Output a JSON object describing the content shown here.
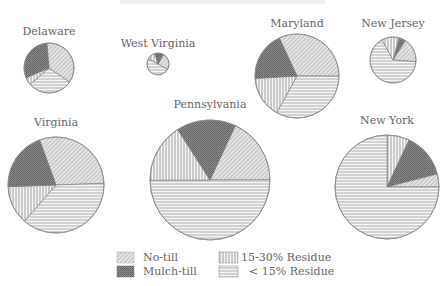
{
  "chart_data": {
    "type": "pie",
    "title": "",
    "legend": {
      "position": "bottom-center",
      "entries": [
        {
          "key": "no_till",
          "label": "No-till"
        },
        {
          "key": "mulch_till",
          "label": "Mulch-till"
        },
        {
          "key": "residue_15_30",
          "label": "15-30% Residue"
        },
        {
          "key": "residue_lt_15",
          "label": "< 15% Residue"
        }
      ]
    },
    "categories": [
      "No-till",
      "Mulch-till",
      "15-30% Residue",
      "< 15% Residue"
    ],
    "pies": [
      {
        "state": "Delaware",
        "cx": 49,
        "cy": 68,
        "r": 25,
        "label_y": 35,
        "slices": [
          {
            "cat": "no_till",
            "value": 36
          },
          {
            "cat": "residue_lt_15",
            "value": 29
          },
          {
            "cat": "residue_15_30",
            "value": 5
          },
          {
            "cat": "mulch_till",
            "value": 30
          }
        ],
        "start_angle": -95
      },
      {
        "state": "West Virginia",
        "cx": 158,
        "cy": 64,
        "r": 11,
        "label_y": 47,
        "slices": [
          {
            "cat": "no_till",
            "value": 25
          },
          {
            "cat": "residue_lt_15",
            "value": 50
          },
          {
            "cat": "residue_15_30",
            "value": 12
          },
          {
            "cat": "mulch_till",
            "value": 13
          }
        ],
        "start_angle": -60
      },
      {
        "state": "Maryland",
        "cx": 297,
        "cy": 76,
        "r": 42,
        "label_y": 27,
        "slices": [
          {
            "cat": "no_till",
            "value": 32
          },
          {
            "cat": "residue_lt_15",
            "value": 33
          },
          {
            "cat": "residue_15_30",
            "value": 16
          },
          {
            "cat": "mulch_till",
            "value": 19
          }
        ],
        "start_angle": -115
      },
      {
        "state": "New Jersey",
        "cx": 393,
        "cy": 60,
        "r": 23,
        "label_y": 27,
        "slices": [
          {
            "cat": "mulch_till",
            "value": 5
          },
          {
            "cat": "no_till",
            "value": 17
          },
          {
            "cat": "residue_lt_15",
            "value": 66
          },
          {
            "cat": "residue_15_30",
            "value": 12
          }
        ],
        "start_angle": -75
      },
      {
        "state": "Virginia",
        "cx": 56,
        "cy": 185,
        "r": 48,
        "label_y": 126,
        "slices": [
          {
            "cat": "no_till",
            "value": 30
          },
          {
            "cat": "residue_lt_15",
            "value": 37
          },
          {
            "cat": "residue_15_30",
            "value": 13
          },
          {
            "cat": "mulch_till",
            "value": 20
          }
        ],
        "start_angle": -110
      },
      {
        "state": "Pennsylvania",
        "cx": 210,
        "cy": 180,
        "r": 60,
        "label_y": 108,
        "slices": [
          {
            "cat": "no_till",
            "value": 18
          },
          {
            "cat": "residue_lt_15",
            "value": 50
          },
          {
            "cat": "residue_15_30",
            "value": 16
          },
          {
            "cat": "mulch_till",
            "value": 16
          }
        ],
        "start_angle": -65
      },
      {
        "state": "New York",
        "cx": 387,
        "cy": 187,
        "r": 52,
        "label_y": 124,
        "slices": [
          {
            "cat": "residue_15_30",
            "value": 7
          },
          {
            "cat": "mulch_till",
            "value": 14
          },
          {
            "cat": "no_till",
            "value": 4
          },
          {
            "cat": "residue_lt_15",
            "value": 75
          }
        ],
        "start_angle": -90
      }
    ]
  },
  "legend_labels": {
    "no_till": "No-till",
    "mulch_till": "Mulch-till",
    "residue_15_30": "15-30% Residue",
    "residue_lt_15": "< 15% Residue"
  }
}
